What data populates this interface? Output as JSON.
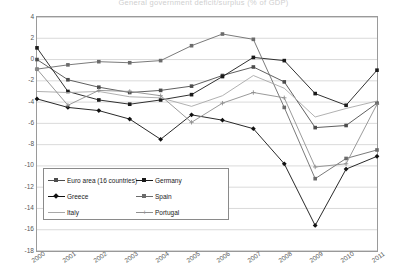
{
  "chart_data": {
    "type": "line",
    "title": "General government deficit/surplus (% of GDP)",
    "xlabel": "",
    "ylabel": "",
    "x": [
      "2000",
      "2001",
      "2002",
      "2003",
      "2004",
      "2005",
      "2006",
      "2007",
      "2008",
      "2009",
      "2010",
      "2011"
    ],
    "ylim": [
      -18,
      4
    ],
    "yticks": [
      4,
      2,
      0,
      -2,
      -4,
      -6,
      -8,
      -10,
      -12,
      -14,
      -16,
      -18
    ],
    "grid": true,
    "legend_position": "inside-lower-left",
    "series": [
      {
        "name": "Euro area (16 countries)",
        "color": "#4d4d4d",
        "marker": "square",
        "values": [
          0.0,
          -1.9,
          -2.6,
          -3.1,
          -2.9,
          -2.5,
          -1.5,
          -0.7,
          -2.1,
          -6.4,
          -6.2,
          -4.1
        ]
      },
      {
        "name": "Germany",
        "color": "#1a1a1a",
        "marker": "square",
        "values": [
          1.1,
          -3.0,
          -3.8,
          -4.2,
          -3.8,
          -3.3,
          -1.6,
          0.2,
          -0.1,
          -3.2,
          -4.3,
          -1.0
        ]
      },
      {
        "name": "Greece",
        "color": "#111111",
        "marker": "diamond",
        "values": [
          -3.7,
          -4.5,
          -4.8,
          -5.6,
          -7.5,
          -5.2,
          -5.7,
          -6.5,
          -9.8,
          -15.6,
          -10.3,
          -9.1
        ]
      },
      {
        "name": "Spain",
        "color": "#6b6b6b",
        "marker": "square",
        "values": [
          -0.9,
          -0.5,
          -0.2,
          -0.3,
          -0.1,
          1.3,
          2.4,
          1.9,
          -4.5,
          -11.2,
          -9.3,
          -8.5
        ]
      },
      {
        "name": "Italy",
        "color": "#a8a8a8",
        "marker": "none",
        "values": [
          -3.0,
          -3.1,
          -3.0,
          -3.5,
          -3.6,
          -4.4,
          -3.4,
          -1.5,
          -2.7,
          -5.4,
          -4.6,
          -3.9
        ]
      },
      {
        "name": "Portugal",
        "color": "#8f8f8f",
        "marker": "plus",
        "values": [
          -0.9,
          -4.3,
          -2.9,
          -3.0,
          -3.4,
          -5.9,
          -4.1,
          -3.1,
          -3.6,
          -10.1,
          -9.8,
          -4.2
        ]
      }
    ]
  },
  "legend": {
    "items": [
      {
        "label": "Euro area (16 countries)"
      },
      {
        "label": "Germany"
      },
      {
        "label": "Greece"
      },
      {
        "label": "Spain"
      },
      {
        "label": "Italy"
      },
      {
        "label": "Portugal"
      }
    ]
  }
}
